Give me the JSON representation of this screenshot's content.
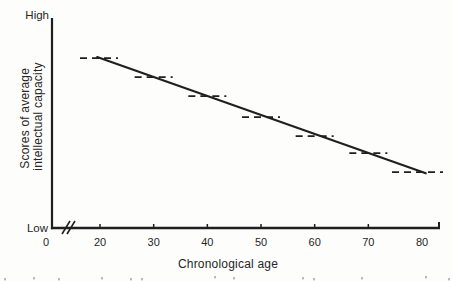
{
  "chart_data": {
    "type": "line",
    "title": "",
    "xlabel": "Chronological age",
    "ylabel": "Scores of average intellectual capacity",
    "ylabel_line1": "Scores of average",
    "ylabel_line2": "intellectual capacity",
    "y_axis_qualitative": {
      "top": "High",
      "bottom": "Low"
    },
    "x_tick_labels": [
      "0",
      "20",
      "30",
      "40",
      "50",
      "60",
      "70",
      "80"
    ],
    "x_axis_break_between": [
      "0",
      "20"
    ],
    "axis_ranges": {
      "x_age": [
        20,
        80
      ],
      "y_relative": [
        0,
        1
      ]
    },
    "grid": false,
    "legend": false,
    "series": [
      {
        "name": "linear decline trend",
        "style": "solid",
        "points": [
          {
            "age": 20,
            "score_rel": 0.81
          },
          {
            "age": 80,
            "score_rel": 0.27
          }
        ]
      },
      {
        "name": "decade plateau segments",
        "style": "dashed",
        "points": [
          {
            "age": 20,
            "score_rel": 0.81
          },
          {
            "age": 30,
            "score_rel": 0.72
          },
          {
            "age": 40,
            "score_rel": 0.63
          },
          {
            "age": 50,
            "score_rel": 0.53
          },
          {
            "age": 60,
            "score_rel": 0.44
          },
          {
            "age": 70,
            "score_rel": 0.36
          },
          {
            "age": 80,
            "score_rel": 0.27
          }
        ]
      }
    ],
    "ink_color": "#1f1f1f",
    "background_color": "#fdfdfc"
  }
}
